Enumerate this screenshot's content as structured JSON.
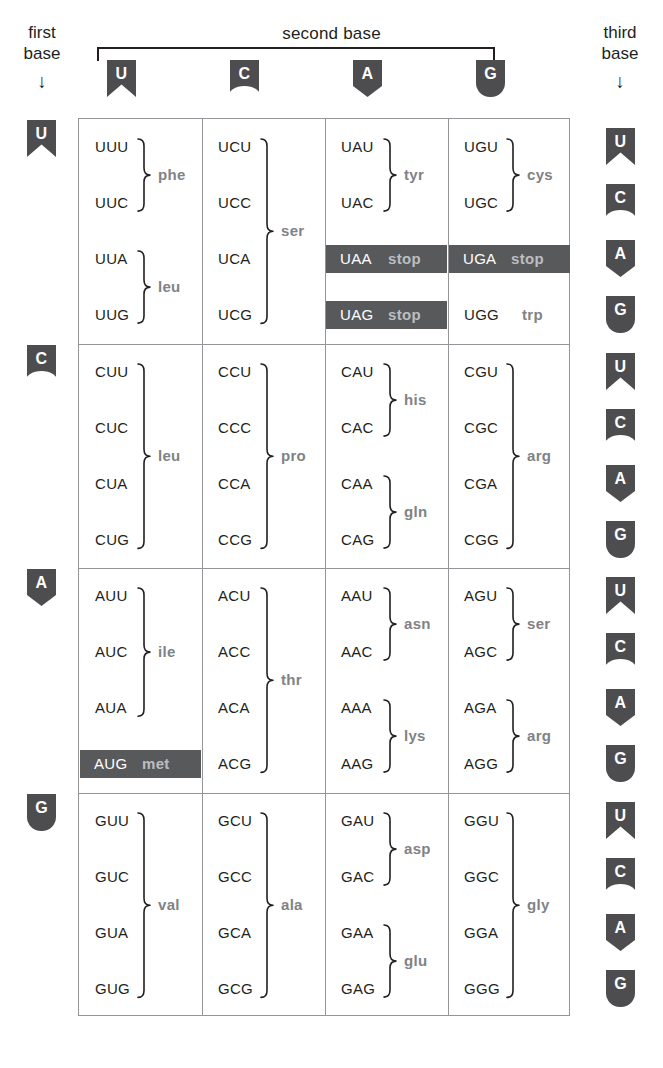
{
  "labels": {
    "second_base": "second base",
    "first_base": "first base",
    "first_base_line1": "first",
    "first_base_line2": "base",
    "third_base_line1": "third",
    "third_base_line2": "base",
    "arrow": "↓"
  },
  "second_base_headers": [
    {
      "base": "U",
      "shape": "U"
    },
    {
      "base": "C",
      "shape": "C"
    },
    {
      "base": "A",
      "shape": "A"
    },
    {
      "base": "G",
      "shape": "G"
    }
  ],
  "first_base_headers": [
    {
      "base": "U",
      "shape": "U"
    },
    {
      "base": "C",
      "shape": "C"
    },
    {
      "base": "A",
      "shape": "A"
    },
    {
      "base": "G",
      "shape": "G"
    }
  ],
  "third_base_headers": [
    {
      "base": "U",
      "shape": "U"
    },
    {
      "base": "C",
      "shape": "C"
    },
    {
      "base": "A",
      "shape": "A"
    },
    {
      "base": "G",
      "shape": "G"
    },
    {
      "base": "U",
      "shape": "U"
    },
    {
      "base": "C",
      "shape": "C"
    },
    {
      "base": "A",
      "shape": "A"
    },
    {
      "base": "G",
      "shape": "G"
    },
    {
      "base": "U",
      "shape": "U"
    },
    {
      "base": "C",
      "shape": "C"
    },
    {
      "base": "A",
      "shape": "A"
    },
    {
      "base": "G",
      "shape": "G"
    },
    {
      "base": "U",
      "shape": "U"
    },
    {
      "base": "C",
      "shape": "C"
    },
    {
      "base": "A",
      "shape": "A"
    },
    {
      "base": "G",
      "shape": "G"
    }
  ],
  "colors": {
    "badge_bg": "#4d4d4f",
    "badge_text": "#ffffff",
    "grid_line": "#939598",
    "codon_text": "#231f20",
    "amino_acid_text": "#808285",
    "highlight_band": "#58595b",
    "highlight_codon_text": "#ffffff",
    "highlight_aa_text": "#bcbec0",
    "page_background": "#ffffff"
  },
  "cells": [
    {
      "first": "U",
      "second": "U",
      "codons": [
        "UUU",
        "UUC",
        "UUA",
        "UUG"
      ],
      "groups": [
        {
          "label": "phe",
          "codons": [
            "UUU",
            "UUC"
          ],
          "highlight": false
        },
        {
          "label": "leu",
          "codons": [
            "UUA",
            "UUG"
          ],
          "highlight": false
        }
      ]
    },
    {
      "first": "U",
      "second": "C",
      "codons": [
        "UCU",
        "UCC",
        "UCA",
        "UCG"
      ],
      "groups": [
        {
          "label": "ser",
          "codons": [
            "UCU",
            "UCC",
            "UCA",
            "UCG"
          ],
          "highlight": false
        }
      ]
    },
    {
      "first": "U",
      "second": "A",
      "codons": [
        "UAU",
        "UAC",
        "UAA",
        "UAG"
      ],
      "groups": [
        {
          "label": "tyr",
          "codons": [
            "UAU",
            "UAC"
          ],
          "highlight": false
        },
        {
          "label": "stop",
          "codons": [
            "UAA"
          ],
          "highlight": true
        },
        {
          "label": "stop",
          "codons": [
            "UAG"
          ],
          "highlight": true
        }
      ]
    },
    {
      "first": "U",
      "second": "G",
      "codons": [
        "UGU",
        "UGC",
        "UGA",
        "UGG"
      ],
      "groups": [
        {
          "label": "cys",
          "codons": [
            "UGU",
            "UGC"
          ],
          "highlight": false
        },
        {
          "label": "stop",
          "codons": [
            "UGA"
          ],
          "highlight": true
        },
        {
          "label": "trp",
          "codons": [
            "UGG"
          ],
          "highlight": false
        }
      ]
    },
    {
      "first": "C",
      "second": "U",
      "codons": [
        "CUU",
        "CUC",
        "CUA",
        "CUG"
      ],
      "groups": [
        {
          "label": "leu",
          "codons": [
            "CUU",
            "CUC",
            "CUA",
            "CUG"
          ],
          "highlight": false
        }
      ]
    },
    {
      "first": "C",
      "second": "C",
      "codons": [
        "CCU",
        "CCC",
        "CCA",
        "CCG"
      ],
      "groups": [
        {
          "label": "pro",
          "codons": [
            "CCU",
            "CCC",
            "CCA",
            "CCG"
          ],
          "highlight": false
        }
      ]
    },
    {
      "first": "C",
      "second": "A",
      "codons": [
        "CAU",
        "CAC",
        "CAA",
        "CAG"
      ],
      "groups": [
        {
          "label": "his",
          "codons": [
            "CAU",
            "CAC"
          ],
          "highlight": false
        },
        {
          "label": "gln",
          "codons": [
            "CAA",
            "CAG"
          ],
          "highlight": false
        }
      ]
    },
    {
      "first": "C",
      "second": "G",
      "codons": [
        "CGU",
        "CGC",
        "CGA",
        "CGG"
      ],
      "groups": [
        {
          "label": "arg",
          "codons": [
            "CGU",
            "CGC",
            "CGA",
            "CGG"
          ],
          "highlight": false
        }
      ]
    },
    {
      "first": "A",
      "second": "U",
      "codons": [
        "AUU",
        "AUC",
        "AUA",
        "AUG"
      ],
      "groups": [
        {
          "label": "ile",
          "codons": [
            "AUU",
            "AUC",
            "AUA"
          ],
          "highlight": false
        },
        {
          "label": "met",
          "codons": [
            "AUG"
          ],
          "highlight": true
        }
      ]
    },
    {
      "first": "A",
      "second": "C",
      "codons": [
        "ACU",
        "ACC",
        "ACA",
        "ACG"
      ],
      "groups": [
        {
          "label": "thr",
          "codons": [
            "ACU",
            "ACC",
            "ACA",
            "ACG"
          ],
          "highlight": false
        }
      ]
    },
    {
      "first": "A",
      "second": "A",
      "codons": [
        "AAU",
        "AAC",
        "AAA",
        "AAG"
      ],
      "groups": [
        {
          "label": "asn",
          "codons": [
            "AAU",
            "AAC"
          ],
          "highlight": false
        },
        {
          "label": "lys",
          "codons": [
            "AAA",
            "AAG"
          ],
          "highlight": false
        }
      ]
    },
    {
      "first": "A",
      "second": "G",
      "codons": [
        "AGU",
        "AGC",
        "AGA",
        "AGG"
      ],
      "groups": [
        {
          "label": "ser",
          "codons": [
            "AGU",
            "AGC"
          ],
          "highlight": false
        },
        {
          "label": "arg",
          "codons": [
            "AGA",
            "AGG"
          ],
          "highlight": false
        }
      ]
    },
    {
      "first": "G",
      "second": "U",
      "codons": [
        "GUU",
        "GUC",
        "GUA",
        "GUG"
      ],
      "groups": [
        {
          "label": "val",
          "codons": [
            "GUU",
            "GUC",
            "GUA",
            "GUG"
          ],
          "highlight": false
        }
      ]
    },
    {
      "first": "G",
      "second": "C",
      "codons": [
        "GCU",
        "GCC",
        "GCA",
        "GCG"
      ],
      "groups": [
        {
          "label": "ala",
          "codons": [
            "GCU",
            "GCC",
            "GCA",
            "GCG"
          ],
          "highlight": false
        }
      ]
    },
    {
      "first": "G",
      "second": "A",
      "codons": [
        "GAU",
        "GAC",
        "GAA",
        "GAG"
      ],
      "groups": [
        {
          "label": "asp",
          "codons": [
            "GAU",
            "GAC"
          ],
          "highlight": false
        },
        {
          "label": "glu",
          "codons": [
            "GAA",
            "GAG"
          ],
          "highlight": false
        }
      ]
    },
    {
      "first": "G",
      "second": "G",
      "codons": [
        "GGU",
        "GGC",
        "GGA",
        "GGG"
      ],
      "groups": [
        {
          "label": "gly",
          "codons": [
            "GGU",
            "GGC",
            "GGA",
            "GGG"
          ],
          "highlight": false
        }
      ]
    }
  ]
}
